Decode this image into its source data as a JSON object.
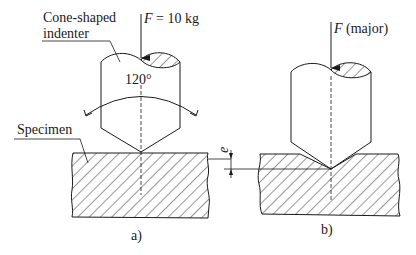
{
  "figure": {
    "panel_a": {
      "label": "a)",
      "indenter_label_line1": "Cone-shaped",
      "indenter_label_line2": "indenter",
      "force_symbol": "F",
      "force_value": " = 10 kg",
      "angle_label": "120°",
      "specimen_label": "Specimen"
    },
    "panel_b": {
      "label": "b)",
      "force_symbol": "F",
      "force_value": " (major)",
      "depth_label": "e"
    },
    "colors": {
      "line": "#1a1a1a",
      "background": "#ffffff"
    }
  }
}
